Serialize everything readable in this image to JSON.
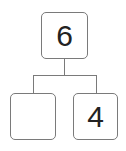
{
  "diagram": {
    "type": "number-bond",
    "whole": {
      "value": "6"
    },
    "parts": [
      {
        "value": ""
      },
      {
        "value": "4"
      }
    ],
    "colors": {
      "stroke": "#7a7a7a",
      "text": "#222222",
      "background": "#ffffff"
    }
  }
}
